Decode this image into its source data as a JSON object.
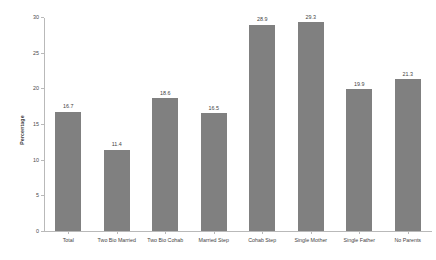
{
  "chart_data": {
    "type": "bar",
    "title": "",
    "xlabel": "",
    "ylabel": "Percentage",
    "ylim": [
      0,
      30
    ],
    "ytick_values": [
      0,
      5,
      10,
      15,
      20,
      25,
      30
    ],
    "ytick_labels": [
      "0",
      "5",
      "10",
      "15",
      "20",
      "25",
      "30"
    ],
    "grid": false,
    "legend": false,
    "bar_color": "#808080",
    "axis_color": "#b9b9b9",
    "categories": [
      "Total",
      "Two Bio Married",
      "Two Bio Cohab",
      "Married Step",
      "Cohab Step",
      "Single Mother",
      "Single Father",
      "No Parents"
    ],
    "values": [
      16.7,
      11.4,
      18.6,
      16.5,
      28.9,
      29.3,
      19.9,
      21.3
    ],
    "value_labels": [
      "16.7",
      "11.4",
      "18.6",
      "16.5",
      "28.9",
      "29.3",
      "19.9",
      "21.3"
    ]
  }
}
